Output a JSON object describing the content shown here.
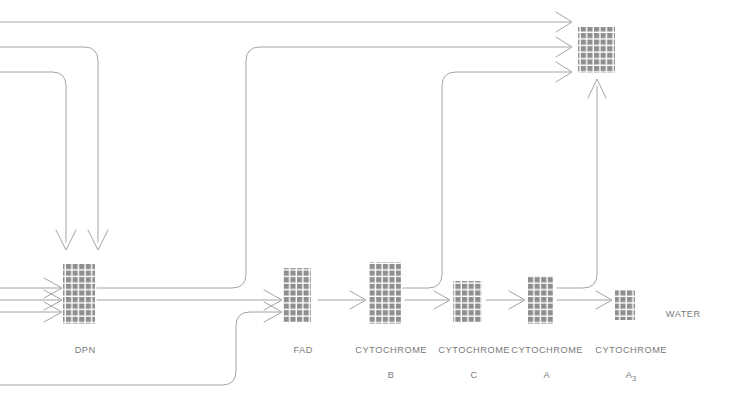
{
  "diagram": {
    "background_color": "#ffffff",
    "line_color": "#8d8d8d",
    "block_color": "#8f8f8f",
    "block_grid_color": "#ffffff",
    "label_color": "#7a7a7a",
    "nodes": [
      {
        "id": "dpn",
        "label": "DPN",
        "sub": "",
        "x": 63,
        "y": 264,
        "w": 32,
        "h": 60,
        "cols": 5,
        "rows": 9,
        "label_x": 79,
        "label_y": 330
      },
      {
        "id": "fad",
        "label": "FAD",
        "sub": "",
        "x": 283,
        "y": 268,
        "w": 28,
        "h": 54,
        "cols": 4,
        "rows": 8,
        "label_x": 297,
        "label_y": 330
      },
      {
        "id": "cytochrome_b",
        "label": "CYTOCHROME",
        "sub": "B",
        "x": 369,
        "y": 262,
        "w": 32,
        "h": 62,
        "cols": 5,
        "rows": 9,
        "label_x": 385,
        "label_y": 330
      },
      {
        "id": "cytochrome_c",
        "label": "CYTOCHROME",
        "sub": "C",
        "x": 453,
        "y": 281,
        "w": 29,
        "h": 41,
        "cols": 5,
        "rows": 6,
        "label_x": 468,
        "label_y": 330
      },
      {
        "id": "cytochrome_a",
        "label": "CYTOCHROME",
        "sub": "A",
        "x": 528,
        "y": 276,
        "w": 25,
        "h": 48,
        "cols": 4,
        "rows": 7,
        "label_x": 541,
        "label_y": 330
      },
      {
        "id": "cytochrome_a3",
        "label": "CYTOCHROME",
        "sub": "A3",
        "x": 615,
        "y": 290,
        "w": 20,
        "h": 30,
        "cols": 3,
        "rows": 4,
        "label_x": 625,
        "label_y": 330
      },
      {
        "id": "oxygen_block",
        "label": "",
        "sub": "",
        "x": 578,
        "y": 27,
        "w": 37,
        "h": 46,
        "cols": 6,
        "rows": 7,
        "label_x": 0,
        "label_y": 0
      }
    ],
    "text_labels": [
      {
        "id": "water",
        "text": "WATER",
        "x": 672,
        "y": 295
      }
    ],
    "flows": [
      {
        "id": "substrate-in-1",
        "from": "left-edge",
        "to": "dpn"
      },
      {
        "id": "substrate-in-2",
        "from": "left-edge",
        "to": "dpn"
      },
      {
        "id": "substrate-in-3",
        "from": "left-edge",
        "to": "dpn"
      },
      {
        "id": "top-feed-1",
        "from": "left-edge",
        "to": "dpn"
      },
      {
        "id": "top-feed-2",
        "from": "left-edge",
        "to": "dpn"
      },
      {
        "id": "dpn-to-oxygen",
        "from": "dpn",
        "to": "oxygen_block"
      },
      {
        "id": "dpn-to-fad",
        "from": "dpn",
        "to": "fad"
      },
      {
        "id": "bottom-feed-fad",
        "from": "left-edge",
        "to": "fad"
      },
      {
        "id": "fad-to-b",
        "from": "fad",
        "to": "cytochrome_b"
      },
      {
        "id": "b-to-oxygen",
        "from": "cytochrome_b",
        "to": "oxygen_block"
      },
      {
        "id": "b-to-c",
        "from": "cytochrome_b",
        "to": "cytochrome_c"
      },
      {
        "id": "c-to-a",
        "from": "cytochrome_c",
        "to": "cytochrome_a"
      },
      {
        "id": "a-to-oxygen",
        "from": "cytochrome_a",
        "to": "oxygen_block"
      },
      {
        "id": "a-to-a3",
        "from": "cytochrome_a",
        "to": "cytochrome_a3"
      },
      {
        "id": "top-line-to-oxygen",
        "from": "left-edge",
        "to": "oxygen_block"
      }
    ]
  }
}
